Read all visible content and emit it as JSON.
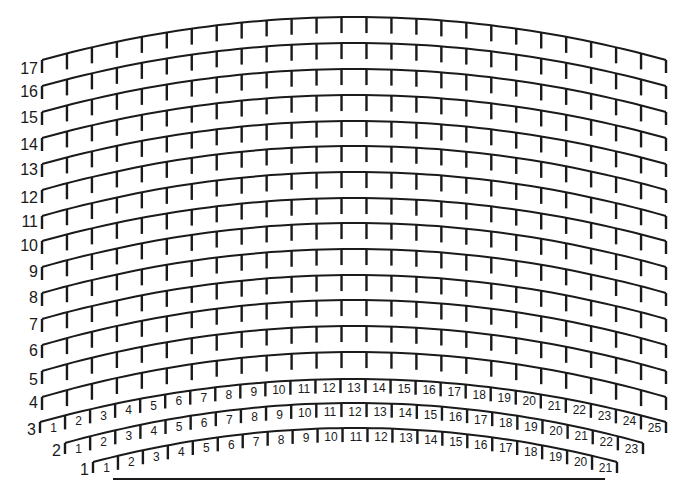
{
  "diagram": {
    "type": "theater-seating-plan",
    "stroke_color": "#1a1a1a",
    "background": "#ffffff",
    "stage_line": {
      "x1": 113,
      "x2": 605,
      "y": 479
    },
    "rows": [
      {
        "label": "17",
        "seats": 25,
        "numbered": false,
        "x_left": 42,
        "x_right": 666,
        "y_end": 60,
        "y_peak": 17,
        "label_y": 74
      },
      {
        "label": "16",
        "seats": 25,
        "numbered": false,
        "x_left": 42,
        "x_right": 666,
        "y_end": 86,
        "y_peak": 43,
        "label_y": 97
      },
      {
        "label": "15",
        "seats": 25,
        "numbered": false,
        "x_left": 42,
        "x_right": 666,
        "y_end": 112,
        "y_peak": 69,
        "label_y": 123
      },
      {
        "label": "14",
        "seats": 25,
        "numbered": false,
        "x_left": 42,
        "x_right": 666,
        "y_end": 138,
        "y_peak": 95,
        "label_y": 150
      },
      {
        "label": "13",
        "seats": 25,
        "numbered": false,
        "x_left": 42,
        "x_right": 666,
        "y_end": 164,
        "y_peak": 121,
        "label_y": 175
      },
      {
        "label": "12",
        "seats": 25,
        "numbered": false,
        "x_left": 42,
        "x_right": 666,
        "y_end": 190,
        "y_peak": 146,
        "label_y": 203
      },
      {
        "label": "11",
        "seats": 25,
        "numbered": false,
        "x_left": 42,
        "x_right": 666,
        "y_end": 216,
        "y_peak": 172,
        "label_y": 227
      },
      {
        "label": "10",
        "seats": 25,
        "numbered": false,
        "x_left": 42,
        "x_right": 666,
        "y_end": 241,
        "y_peak": 198,
        "label_y": 251
      },
      {
        "label": "9",
        "seats": 25,
        "numbered": false,
        "x_left": 42,
        "x_right": 666,
        "y_end": 267,
        "y_peak": 223,
        "label_y": 277
      },
      {
        "label": "8",
        "seats": 25,
        "numbered": false,
        "x_left": 42,
        "x_right": 666,
        "y_end": 293,
        "y_peak": 249,
        "label_y": 303
      },
      {
        "label": "7",
        "seats": 25,
        "numbered": false,
        "x_left": 42,
        "x_right": 666,
        "y_end": 319,
        "y_peak": 275,
        "label_y": 330
      },
      {
        "label": "6",
        "seats": 25,
        "numbered": false,
        "x_left": 42,
        "x_right": 666,
        "y_end": 345,
        "y_peak": 300,
        "label_y": 356
      },
      {
        "label": "5",
        "seats": 25,
        "numbered": false,
        "x_left": 42,
        "x_right": 666,
        "y_end": 371,
        "y_peak": 326,
        "label_y": 385
      },
      {
        "label": "4",
        "seats": 25,
        "numbered": false,
        "x_left": 42,
        "x_right": 666,
        "y_end": 397,
        "y_peak": 352,
        "label_y": 408
      },
      {
        "label": "3",
        "seats": 25,
        "numbered": true,
        "x_left": 40,
        "x_right": 666,
        "y_end": 422,
        "y_peak": 379,
        "label_y": 435
      },
      {
        "label": "2",
        "seats": 23,
        "numbered": true,
        "x_left": 65,
        "x_right": 643,
        "y_end": 443,
        "y_peak": 403,
        "label_y": 456
      },
      {
        "label": "1",
        "seats": 21,
        "numbered": true,
        "x_left": 93,
        "x_right": 617,
        "y_end": 462,
        "y_peak": 428,
        "label_y": 475
      }
    ]
  },
  "chart_data": {
    "type": "seating-plan",
    "title": "",
    "row_labels": [
      "17",
      "16",
      "15",
      "14",
      "13",
      "12",
      "11",
      "10",
      "9",
      "8",
      "7",
      "6",
      "5",
      "4",
      "3",
      "2",
      "1"
    ],
    "seats_per_row": {
      "17": 25,
      "16": 25,
      "15": 25,
      "14": 25,
      "13": 25,
      "12": 25,
      "11": 25,
      "10": 25,
      "9": 25,
      "8": 25,
      "7": 25,
      "6": 25,
      "5": 25,
      "4": 25,
      "3": 25,
      "2": 23,
      "1": 21
    },
    "numbered_rows": {
      "3": [
        "1",
        "2",
        "3",
        "4",
        "5",
        "6",
        "7",
        "8",
        "9",
        "10",
        "11",
        "12",
        "13",
        "14",
        "15",
        "16",
        "17",
        "18",
        "19",
        "20",
        "21",
        "22",
        "23",
        "24",
        "25"
      ],
      "2": [
        "1",
        "2",
        "3",
        "4",
        "5",
        "6",
        "7",
        "8",
        "9",
        "10",
        "11",
        "12",
        "13",
        "14",
        "15",
        "16",
        "17",
        "18",
        "19",
        "20",
        "21",
        "22",
        "23"
      ],
      "1": [
        "1",
        "2",
        "3",
        "4",
        "5",
        "6",
        "7",
        "8",
        "9",
        "10",
        "11",
        "12",
        "13",
        "14",
        "15",
        "16",
        "17",
        "18",
        "19",
        "20",
        "21"
      ]
    },
    "stage": "straight line below row 1"
  }
}
